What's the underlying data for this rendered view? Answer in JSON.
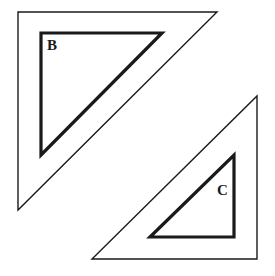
{
  "figure": {
    "background_color": "#ffffff",
    "stroke_color": "#1a1a1a",
    "canvas": {
      "width": 275,
      "height": 276
    },
    "labels": {
      "b": "B",
      "c": "C"
    },
    "shapes": [
      {
        "id": "outer-triangle-b",
        "name": "outer-triangle-b",
        "role": "image-triangle",
        "stroke_width": 1.4,
        "fill": "none",
        "right_angle_at": "top-left",
        "points": "18,12 217,12 18,210",
        "vertices": [
          [
            18,
            12
          ],
          [
            217,
            12
          ],
          [
            18,
            210
          ]
        ]
      },
      {
        "id": "inner-triangle-b",
        "name": "inner-triangle-b",
        "role": "preimage-triangle",
        "stroke_width": 3.2,
        "fill": "none",
        "right_angle_at": "top-left",
        "points": "41,33 162,33 41,155",
        "vertices": [
          [
            41,
            33
          ],
          [
            162,
            33
          ],
          [
            41,
            155
          ]
        ],
        "label": "B"
      },
      {
        "id": "outer-triangle-c",
        "name": "outer-triangle-c",
        "role": "image-triangle",
        "stroke_width": 1.4,
        "fill": "none",
        "right_angle_at": "bottom-right",
        "points": "257,96 257,259 92,259",
        "vertices": [
          [
            257,
            96
          ],
          [
            257,
            259
          ],
          [
            92,
            259
          ]
        ]
      },
      {
        "id": "inner-triangle-c",
        "name": "inner-triangle-c",
        "role": "preimage-triangle",
        "stroke_width": 3.2,
        "fill": "none",
        "right_angle_at": "bottom-right",
        "points": "234,155 234,237 150,237",
        "vertices": [
          [
            234,
            155
          ],
          [
            234,
            237
          ],
          [
            150,
            237
          ]
        ],
        "label": "C"
      }
    ]
  }
}
